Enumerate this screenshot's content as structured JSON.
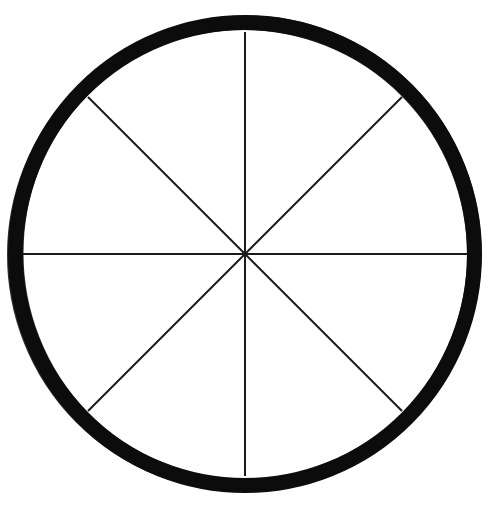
{
  "figure": {
    "title": "Circle divided into eight equal sectors",
    "type": "geometric-diagram",
    "canvas": {
      "width": 497,
      "height": 511,
      "background_color": "#ffffff"
    },
    "circle": {
      "name": "outer-circle",
      "center_x": 245,
      "center_y": 254,
      "outer_radius": 237,
      "inner_radius": 222,
      "ring_thickness": 15,
      "stroke_color": "#0d0d0d",
      "fill_color": "#ffffff",
      "style": "hand-drawn thick ink ring"
    },
    "spokes": {
      "count": 8,
      "stroke_color": "#1a1a1a",
      "stroke_width": 2,
      "sector_angle_degrees": 45,
      "description": "Eight radii drawn from the center to the inner edge of the ring, splitting the disc into eight equal wedges",
      "items": [
        {
          "label": "spoke-up",
          "angle_degrees": 270,
          "end_x": 245,
          "end_y": 32
        },
        {
          "label": "spoke-upper-right",
          "angle_degrees": 315,
          "end_x": 402,
          "end_y": 97
        },
        {
          "label": "spoke-right",
          "angle_degrees": 0,
          "end_x": 467,
          "end_y": 254
        },
        {
          "label": "spoke-lower-right",
          "angle_degrees": 45,
          "end_x": 402,
          "end_y": 411
        },
        {
          "label": "spoke-down",
          "angle_degrees": 90,
          "end_x": 245,
          "end_y": 476
        },
        {
          "label": "spoke-lower-left",
          "angle_degrees": 135,
          "end_x": 88,
          "end_y": 411
        },
        {
          "label": "spoke-left",
          "angle_degrees": 180,
          "end_x": 23,
          "end_y": 254
        },
        {
          "label": "spoke-upper-left",
          "angle_degrees": 225,
          "end_x": 88,
          "end_y": 97
        }
      ]
    },
    "sectors": {
      "count": 8,
      "each_fraction": "1/8",
      "fill_color": "#ffffff"
    }
  },
  "chart_data": {
    "type": "pie",
    "title": "Circle divided into eight equal sectors",
    "categories": [
      "1",
      "2",
      "3",
      "4",
      "5",
      "6",
      "7",
      "8"
    ],
    "values": [
      12.5,
      12.5,
      12.5,
      12.5,
      12.5,
      12.5,
      12.5,
      12.5
    ],
    "units": "percent",
    "legend": "none",
    "labels_visible": false,
    "slice_fill": "#ffffff",
    "slice_border": "#1a1a1a",
    "outer_border": "#0d0d0d"
  }
}
